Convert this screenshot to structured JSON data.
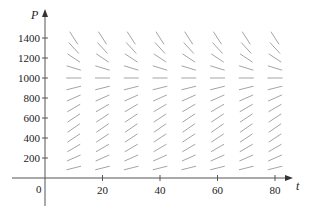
{
  "chart_data": {
    "type": "slope_field",
    "title": "",
    "xlabel": "t",
    "ylabel": "P",
    "origin_label": "0",
    "x_ticks": [
      20,
      40,
      60,
      80
    ],
    "y_ticks": [
      200,
      400,
      600,
      800,
      1000,
      1200,
      1400
    ],
    "xlim": [
      0,
      85
    ],
    "ylim": [
      0,
      1450
    ],
    "grid": false,
    "field_t_values": [
      10,
      20,
      30,
      40,
      50,
      60,
      70,
      80
    ],
    "field_P_values": [
      100,
      200,
      300,
      400,
      500,
      600,
      700,
      800,
      900,
      1000,
      1100,
      1200,
      1300,
      1400
    ],
    "equilibrium_P": 1000,
    "model": "dP/dt = k P (1 - P/1000)",
    "k_estimate": 0.08,
    "segment_color": "#9a9a9a",
    "axis_color": "#555555"
  }
}
